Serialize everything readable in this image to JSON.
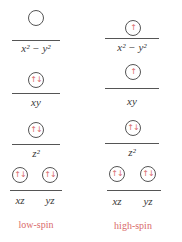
{
  "diagrams": [
    {
      "caption": "low-spin",
      "levels": [
        {
          "label": "x² − y²",
          "orbitals": [
            ""
          ]
        },
        {
          "label": "xy",
          "orbitals": [
            "↑↓"
          ]
        },
        {
          "label": "z²",
          "orbitals": [
            "↑↓"
          ]
        },
        {
          "label": "xz   yz",
          "orbitals": [
            "↑↓",
            "↑↓"
          ],
          "sublabels": [
            "xz",
            "yz"
          ]
        }
      ]
    },
    {
      "caption": "high-spin",
      "levels": [
        {
          "label": "x² − y²",
          "orbitals": [
            "↑"
          ]
        },
        {
          "label": "xy",
          "orbitals": [
            "↑"
          ]
        },
        {
          "label": "z²",
          "orbitals": [
            "↑↓"
          ]
        },
        {
          "label": "xz   yz",
          "orbitals": [
            "↑↓",
            "↑↓"
          ],
          "sublabels": [
            "xz",
            "yz"
          ]
        }
      ]
    }
  ],
  "colors": {
    "electron": "#d96b6b",
    "line": "#555555",
    "caption": "#d96b6b"
  }
}
